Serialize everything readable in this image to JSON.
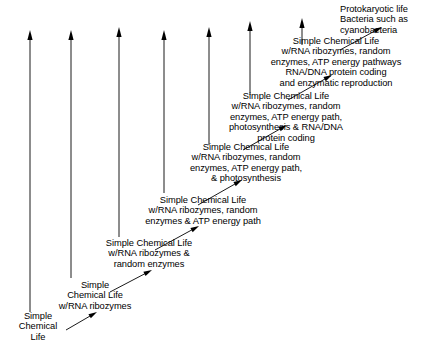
{
  "diagram": {
    "background_color": "#ffffff",
    "ink_color": "#000000",
    "stages": [
      {
        "id": "stage-1",
        "text": "Simple\nChemical\nLife",
        "align": "center",
        "x": 10,
        "y": 311,
        "width": 56
      },
      {
        "id": "stage-2",
        "text": "Simple\nChemical Life\nw/RNA ribozymes",
        "align": "center",
        "x": 42,
        "y": 280,
        "width": 106
      },
      {
        "id": "stage-3",
        "text": "Simple Chemical Life\nw/RNA ribozymes &\nrandom enzymes",
        "align": "center",
        "x": 85,
        "y": 238,
        "width": 128
      },
      {
        "id": "stage-4",
        "text": "Simple Chemical Life\nw/RNA ribozymes, random\nenzymes & ATP energy path",
        "align": "center",
        "x": 127,
        "y": 195,
        "width": 152
      },
      {
        "id": "stage-5",
        "text": "Simple Chemical Life\nw/RNA ribozymes, random\nenzymes, ATP energy path,\n& photosynthesis",
        "align": "center",
        "x": 170,
        "y": 142,
        "width": 152
      },
      {
        "id": "stage-6",
        "text": "Simple Chemical Life\nw/RNA ribozymes, random\nenzymes, ATP energy path,\nphotosynthesis & RNA/DNA\nprotein coding",
        "align": "center",
        "x": 207,
        "y": 91,
        "width": 158
      },
      {
        "id": "stage-7",
        "text": "Simple Chemical Life\nw/RNA ribozymes, random\nenzymes, ATP energy pathways\nRNA/DNA protein coding\nand enzymatic reproduction",
        "align": "center",
        "x": 250,
        "y": 36,
        "width": 172
      },
      {
        "id": "stage-8",
        "text": "Protokaryotic life\nBacteria such as\ncyanobacteria",
        "align": "left",
        "x": 340,
        "y": 4,
        "width": 90
      }
    ],
    "vertical_arrows": [
      {
        "id": "time-arrow-1",
        "x": 30,
        "bottom_y": 312,
        "tip_y": 30
      },
      {
        "id": "time-arrow-2",
        "x": 71,
        "bottom_y": 278,
        "tip_y": 30
      },
      {
        "id": "time-arrow-3",
        "x": 119,
        "bottom_y": 237,
        "tip_y": 27
      },
      {
        "id": "time-arrow-4",
        "x": 164,
        "bottom_y": 193,
        "tip_y": 30
      },
      {
        "id": "time-arrow-5",
        "x": 209,
        "bottom_y": 145,
        "tip_y": 27
      },
      {
        "id": "time-arrow-6",
        "x": 250,
        "bottom_y": 95,
        "tip_y": 21
      },
      {
        "id": "time-arrow-7",
        "x": 302,
        "bottom_y": 45,
        "tip_y": 18
      }
    ],
    "diagonal_arrows": [
      {
        "id": "transition-arrow-1",
        "x1": 66,
        "y1": 330,
        "x2": 97,
        "y2": 312
      },
      {
        "id": "transition-arrow-2",
        "x1": 110,
        "y1": 292,
        "x2": 152,
        "y2": 270
      },
      {
        "id": "transition-arrow-3",
        "x1": 155,
        "y1": 250,
        "x2": 199,
        "y2": 226
      },
      {
        "id": "transition-arrow-4",
        "x1": 198,
        "y1": 205,
        "x2": 242,
        "y2": 180
      },
      {
        "id": "transition-arrow-5",
        "x1": 243,
        "y1": 150,
        "x2": 287,
        "y2": 125
      },
      {
        "id": "transition-arrow-6",
        "x1": 288,
        "y1": 100,
        "x2": 332,
        "y2": 75
      },
      {
        "id": "transition-arrow-7",
        "x1": 340,
        "y1": 50,
        "x2": 382,
        "y2": 27
      }
    ]
  }
}
